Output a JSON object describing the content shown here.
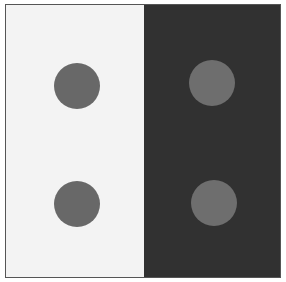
{
  "figure": {
    "frame_color": "#555555",
    "panels": [
      {
        "name": "light-panel",
        "background": "#f3f3f3",
        "dots": [
          {
            "cx": 71,
            "cy": 81,
            "r": 23,
            "color": "#686868"
          },
          {
            "cx": 71,
            "cy": 199,
            "r": 23,
            "color": "#686868"
          }
        ]
      },
      {
        "name": "dark-panel",
        "background": "#313131",
        "dots": [
          {
            "cx": 68,
            "cy": 78,
            "r": 23,
            "color": "#6e6e6e"
          },
          {
            "cx": 70,
            "cy": 198,
            "r": 23,
            "color": "#6e6e6e"
          }
        ]
      }
    ]
  }
}
